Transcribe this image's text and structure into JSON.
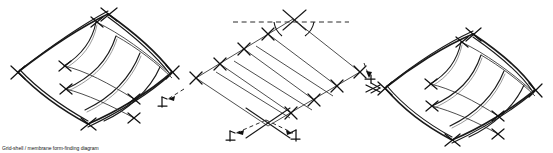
{
  "figure": {
    "title": "Grid-shell / membrane form-finding diagram",
    "background_color": "#ffffff",
    "ink_color": "#1a1a1a",
    "width": 553,
    "height": 153,
    "panel_count": 3
  },
  "panels": [
    {
      "id": "left-perspective",
      "name": "left-shell-perspective",
      "kind": "3d-perspective-grid-shell",
      "caption": "",
      "corner_vertices": [
        {
          "name": "top",
          "x": 108,
          "y": 14
        },
        {
          "name": "right",
          "x": 172,
          "y": 72
        },
        {
          "name": "bottom",
          "x": 88,
          "y": 124
        },
        {
          "name": "left",
          "x": 18,
          "y": 72
        }
      ],
      "rib_count": 4,
      "has_corner_tick_crosses": true,
      "edge_style": "double-line curved"
    },
    {
      "id": "center-plan",
      "name": "center-planar-grid",
      "kind": "planar-parallelogram-grid",
      "caption": "",
      "corner_vertices": [
        {
          "name": "top",
          "x": 293,
          "y": 19
        },
        {
          "name": "right",
          "x": 360,
          "y": 72
        },
        {
          "name": "bottom",
          "x": 268,
          "y": 126
        },
        {
          "name": "left",
          "x": 196,
          "y": 78
        }
      ],
      "rib_count": 4,
      "angle_arcs": 2,
      "datum_line": {
        "label": "",
        "style": "dashed-horizontal",
        "y": 22
      },
      "direction_arrows": 3
    },
    {
      "id": "right-perspective",
      "name": "right-shell-perspective",
      "kind": "3d-perspective-grid-shell",
      "caption": "",
      "corner_vertices": [
        {
          "name": "top",
          "x": 473,
          "y": 34
        },
        {
          "name": "right",
          "x": 535,
          "y": 90
        },
        {
          "name": "bottom",
          "x": 452,
          "y": 140
        },
        {
          "name": "left",
          "x": 385,
          "y": 88
        }
      ],
      "rib_count": 4,
      "has_corner_tick_crosses": true,
      "edge_style": "double-line curved"
    }
  ],
  "annotations": {
    "markers": [
      {
        "id": "m1",
        "name": "left-direction-marker",
        "x": 164,
        "y": 101,
        "glyph": "arrow-marker-icon"
      },
      {
        "id": "m2",
        "name": "lower-left-direction-marker",
        "x": 231,
        "y": 134,
        "glyph": "arrow-marker-icon"
      },
      {
        "id": "m3",
        "name": "lower-right-direction-marker",
        "x": 293,
        "y": 134,
        "glyph": "arrow-marker-icon"
      },
      {
        "id": "m4",
        "name": "right-direction-marker",
        "x": 369,
        "y": 78,
        "glyph": "arrow-marker-icon"
      },
      {
        "id": "m5",
        "name": "right-panel-edge-marker",
        "x": 374,
        "y": 88,
        "glyph": "arrow-marker-icon"
      }
    ],
    "angle_labels": [
      "",
      ""
    ],
    "dimension_labels": []
  },
  "colors": {
    "ink": "#1a1a1a",
    "ink_light": "#3a3a3a",
    "ink_faint": "#6d6d6d",
    "paper": "#ffffff"
  }
}
